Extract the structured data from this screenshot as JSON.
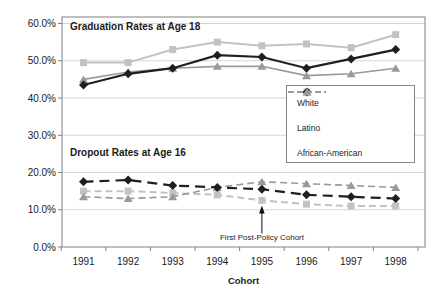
{
  "chart_data": {
    "type": "line",
    "x": [
      "1991",
      "1992",
      "1993",
      "1994",
      "1995",
      "1996",
      "1997",
      "1998"
    ],
    "xlabel": "Cohort",
    "ylim": [
      0,
      60
    ],
    "y_tick_step": 10,
    "y_tick_labels": [
      "0.0%",
      "10.0%",
      "20.0%",
      "30.0%",
      "40.0%",
      "50.0%",
      "60.0%"
    ],
    "grid": true,
    "legend": {
      "position": "middle-right"
    },
    "sections": [
      {
        "label": "Graduation Rates at Age 18",
        "line_style": "solid",
        "series": [
          {
            "name": "White",
            "marker": "square",
            "color": "#c2c2c2",
            "values": [
              49.5,
              49.5,
              53,
              55,
              54,
              54.5,
              53.5,
              57
            ]
          },
          {
            "name": "Latino",
            "marker": "diamond",
            "color": "#1f1f1f",
            "values": [
              43.5,
              46.5,
              48,
              51.5,
              51,
              48,
              50.5,
              53
            ]
          },
          {
            "name": "African-American",
            "marker": "triangle",
            "color": "#9a9a9a",
            "values": [
              45,
              47,
              48,
              48.5,
              48.5,
              46,
              46.5,
              48
            ]
          }
        ]
      },
      {
        "label": "Dropout Rates at Age 16",
        "line_style": "dashed",
        "series": [
          {
            "name": "White",
            "marker": "square",
            "color": "#c2c2c2",
            "values": [
              15,
              15,
              14.5,
              14,
              12.5,
              11.5,
              11,
              11
            ]
          },
          {
            "name": "Latino",
            "marker": "diamond",
            "color": "#1f1f1f",
            "values": [
              17.5,
              18,
              16.5,
              16,
              15.5,
              14,
              13.5,
              13
            ]
          },
          {
            "name": "African-American",
            "marker": "triangle",
            "color": "#9a9a9a",
            "values": [
              13.5,
              13,
              13.5,
              16,
              17.5,
              17,
              16.5,
              16
            ]
          }
        ]
      }
    ],
    "annotation": {
      "text": "First Post-Policy Cohort",
      "points_to": {
        "section": "Dropout Rates at Age 16",
        "series": "White",
        "x": "1995"
      }
    },
    "colors": {
      "gridline": "#d6d6d6",
      "plot_border": "#808080",
      "text": "#1a1a1a"
    }
  }
}
